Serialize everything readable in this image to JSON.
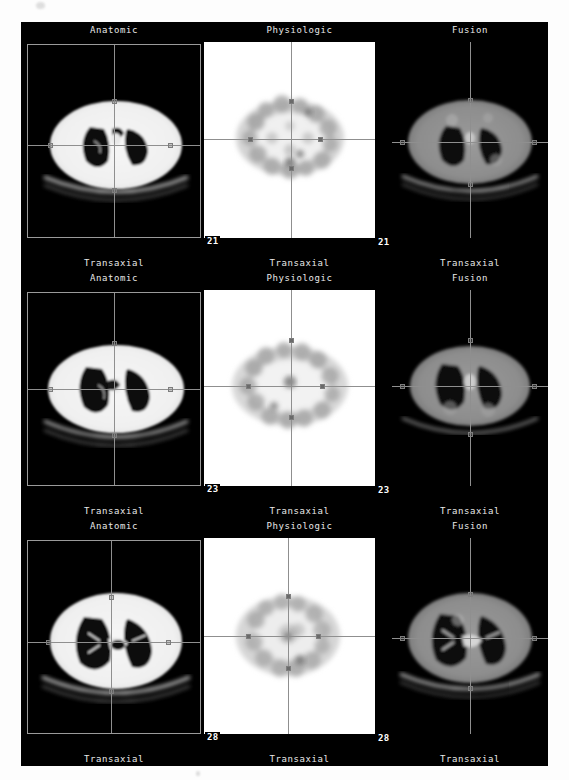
{
  "viewer": {
    "modality": "PET/CT",
    "background_color": "#000000",
    "page_background": "#ffffff"
  },
  "columns": [
    {
      "id": "anatomic",
      "title": "Anatomic",
      "orientation": "Transaxial",
      "image_type": "CT",
      "colormap": "grayscale"
    },
    {
      "id": "physiologic",
      "title": "Physiologic",
      "orientation": "Transaxial",
      "image_type": "PET",
      "colormap": "inverted-grayscale"
    },
    {
      "id": "fusion",
      "title": "Fusion",
      "orientation": "Transaxial",
      "image_type": "PET/CT",
      "colormap": "grayscale"
    }
  ],
  "rows": [
    {
      "slice_number_inside": "21",
      "slice_number_outside": "21",
      "anatomic": {
        "title": "Anatomic",
        "footer": "Transaxial"
      },
      "physiologic": {
        "title": "Physiologic",
        "footer": "Transaxial"
      },
      "fusion": {
        "title": "Fusion",
        "footer": "Transaxial"
      }
    },
    {
      "slice_number_inside": "23",
      "slice_number_outside": "23",
      "anatomic": {
        "title": "Anatomic",
        "footer": "Transaxial"
      },
      "physiologic": {
        "title": "Physiologic",
        "footer": "Transaxial"
      },
      "fusion": {
        "title": "Fusion",
        "footer": "Transaxial"
      }
    },
    {
      "slice_number_inside": "28",
      "slice_number_outside": "28",
      "anatomic": {
        "title": "Anatomic",
        "footer": "Transaxial"
      },
      "physiologic": {
        "title": "Physiologic",
        "footer": "Transaxial"
      },
      "fusion": {
        "title": "Fusion",
        "footer": "Transaxial"
      }
    }
  ],
  "colors": {
    "label_text": "#e8e8e8",
    "crosshair": "#8f8f8f",
    "panel_border": "#9a9a9a",
    "slice_badge_text": "#ffffff",
    "pet_background": "#ffffff"
  }
}
